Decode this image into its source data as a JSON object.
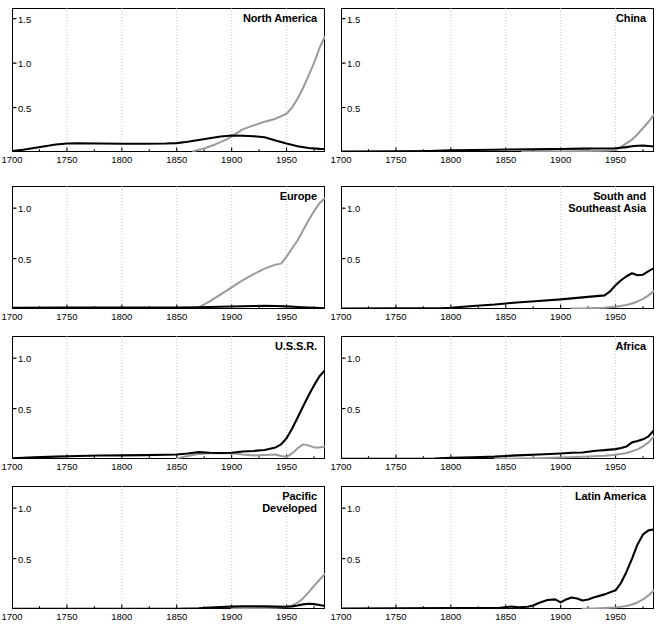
{
  "figure": {
    "layout": "4 rows x 2 columns small-multiples",
    "rows": 4,
    "cols": 2,
    "colors": {
      "black_series": "#000000",
      "gray_series": "#9a9a9a",
      "grid": "#b9b9b9",
      "axis": "#000000",
      "background": "#ffffff"
    }
  },
  "chart_data": [
    {
      "type": "line",
      "title": "North America",
      "xlabel": "",
      "ylabel": "",
      "xlim": [
        1700,
        1985
      ],
      "ylim": [
        0,
        1.62
      ],
      "xticks": [
        1700,
        1750,
        1800,
        1850,
        1900,
        1950
      ],
      "xticklabels": [
        "1700",
        "1750",
        "1800",
        "1850",
        "1900",
        "1950"
      ],
      "yticks": [
        0.5,
        1.0,
        1.5
      ],
      "yticklabels": [
        "0.5",
        "1.0",
        "1.5"
      ],
      "grid": true,
      "legend": "none",
      "series": [
        {
          "name": "black",
          "color": "#000000",
          "x": [
            1700,
            1710,
            1720,
            1730,
            1740,
            1750,
            1760,
            1780,
            1800,
            1820,
            1840,
            1850,
            1860,
            1870,
            1880,
            1890,
            1900,
            1910,
            1920,
            1930,
            1940,
            1950,
            1960,
            1970,
            1980,
            1985
          ],
          "values": [
            0.01,
            0.025,
            0.045,
            0.065,
            0.085,
            0.095,
            0.097,
            0.095,
            0.093,
            0.093,
            0.095,
            0.1,
            0.115,
            0.135,
            0.155,
            0.175,
            0.185,
            0.183,
            0.178,
            0.165,
            0.13,
            0.095,
            0.065,
            0.045,
            0.035,
            0.033
          ]
        },
        {
          "name": "gray",
          "color": "#9a9a9a",
          "x": [
            1865,
            1875,
            1885,
            1895,
            1900,
            1905,
            1910,
            1920,
            1930,
            1940,
            1950,
            1955,
            1960,
            1965,
            1970,
            1975,
            1980,
            1985
          ],
          "values": [
            0.01,
            0.04,
            0.085,
            0.14,
            0.175,
            0.215,
            0.255,
            0.3,
            0.34,
            0.375,
            0.43,
            0.5,
            0.6,
            0.72,
            0.86,
            1.0,
            1.17,
            1.3
          ]
        }
      ]
    },
    {
      "type": "line",
      "title": "China",
      "xlabel": "",
      "ylabel": "",
      "xlim": [
        1700,
        1985
      ],
      "ylim": [
        0,
        1.62
      ],
      "xticks": [
        1700,
        1750,
        1800,
        1850,
        1900,
        1950
      ],
      "xticklabels": [
        "1700",
        "1750",
        "1800",
        "1850",
        "1900",
        "1950"
      ],
      "yticks": [
        0.5,
        1.0,
        1.5
      ],
      "yticklabels": [
        "0.5",
        "1.0",
        "1.5"
      ],
      "grid": true,
      "legend": "none",
      "series": [
        {
          "name": "black",
          "color": "#000000",
          "x": [
            1700,
            1750,
            1780,
            1800,
            1820,
            1840,
            1850,
            1870,
            1890,
            1900,
            1920,
            1930,
            1940,
            1950,
            1960,
            1965,
            1970,
            1975,
            1980,
            1985
          ],
          "values": [
            0.005,
            0.008,
            0.012,
            0.018,
            0.022,
            0.026,
            0.028,
            0.03,
            0.032,
            0.034,
            0.038,
            0.04,
            0.04,
            0.042,
            0.055,
            0.065,
            0.07,
            0.072,
            0.068,
            0.062
          ]
        },
        {
          "name": "gray",
          "color": "#9a9a9a",
          "x": [
            1865,
            1880,
            1900,
            1920,
            1940,
            1950,
            1955,
            1960,
            1965,
            1970,
            1975,
            1980,
            1985
          ],
          "values": [
            0.004,
            0.005,
            0.007,
            0.01,
            0.014,
            0.022,
            0.055,
            0.1,
            0.14,
            0.2,
            0.27,
            0.34,
            0.42
          ]
        }
      ]
    },
    {
      "type": "line",
      "title": "Europe",
      "xlabel": "",
      "ylabel": "",
      "xlim": [
        1700,
        1985
      ],
      "ylim": [
        0,
        1.22
      ],
      "xticks": [
        1700,
        1750,
        1800,
        1850,
        1900,
        1950
      ],
      "xticklabels": [
        "1700",
        "1750",
        "1800",
        "1850",
        "1900",
        "1950"
      ],
      "yticks": [
        0.5,
        1.0
      ],
      "yticklabels": [
        "0.5",
        "1.0"
      ],
      "grid": true,
      "legend": "none",
      "series": [
        {
          "name": "black",
          "color": "#000000",
          "x": [
            1700,
            1750,
            1800,
            1850,
            1870,
            1880,
            1890,
            1900,
            1910,
            1920,
            1930,
            1940,
            1950,
            1960,
            1970,
            1980,
            1985
          ],
          "values": [
            0.012,
            0.014,
            0.014,
            0.015,
            0.018,
            0.02,
            0.022,
            0.025,
            0.028,
            0.03,
            0.032,
            0.03,
            0.026,
            0.02,
            0.014,
            0.01,
            0.008
          ]
        },
        {
          "name": "gray",
          "color": "#9a9a9a",
          "x": [
            1870,
            1880,
            1890,
            1900,
            1910,
            1920,
            1930,
            1940,
            1945,
            1950,
            1955,
            1960,
            1965,
            1970,
            1975,
            1980,
            1985
          ],
          "values": [
            0.015,
            0.075,
            0.145,
            0.215,
            0.285,
            0.345,
            0.4,
            0.44,
            0.45,
            0.52,
            0.6,
            0.68,
            0.78,
            0.88,
            0.97,
            1.05,
            1.1
          ]
        }
      ]
    },
    {
      "type": "line",
      "title": "South and\nSoutheast Asia",
      "xlabel": "",
      "ylabel": "",
      "xlim": [
        1700,
        1985
      ],
      "ylim": [
        0,
        1.22
      ],
      "xticks": [
        1700,
        1750,
        1800,
        1850,
        1900,
        1950
      ],
      "xticklabels": [
        "1700",
        "1750",
        "1800",
        "1850",
        "1900",
        "1950"
      ],
      "yticks": [
        0.5,
        1.0
      ],
      "yticklabels": [
        "0.5",
        "1.0"
      ],
      "grid": true,
      "legend": "none",
      "series": [
        {
          "name": "black",
          "color": "#000000",
          "x": [
            1700,
            1750,
            1790,
            1800,
            1820,
            1840,
            1850,
            1860,
            1880,
            1900,
            1920,
            1930,
            1940,
            1945,
            1950,
            1955,
            1960,
            1965,
            1970,
            1975,
            1980,
            1985
          ],
          "values": [
            0.005,
            0.006,
            0.008,
            0.012,
            0.03,
            0.045,
            0.055,
            0.065,
            0.08,
            0.095,
            0.115,
            0.125,
            0.135,
            0.175,
            0.235,
            0.285,
            0.325,
            0.355,
            0.335,
            0.34,
            0.375,
            0.405
          ]
        },
        {
          "name": "gray",
          "color": "#9a9a9a",
          "x": [
            1910,
            1920,
            1930,
            1940,
            1950,
            1960,
            1965,
            1970,
            1975,
            1980,
            1985
          ],
          "values": [
            0.004,
            0.006,
            0.009,
            0.013,
            0.022,
            0.04,
            0.055,
            0.075,
            0.1,
            0.135,
            0.18
          ]
        }
      ]
    },
    {
      "type": "line",
      "title": "U.S.S.R.",
      "xlabel": "",
      "ylabel": "",
      "xlim": [
        1700,
        1985
      ],
      "ylim": [
        0,
        1.22
      ],
      "xticks": [
        1700,
        1750,
        1800,
        1850,
        1900,
        1950
      ],
      "xticklabels": [
        "1700",
        "1750",
        "1800",
        "1850",
        "1900",
        "1950"
      ],
      "yticks": [
        0.5,
        1.0
      ],
      "yticklabels": [
        "0.5",
        "1.0"
      ],
      "grid": true,
      "legend": "none",
      "series": [
        {
          "name": "black",
          "color": "#000000",
          "x": [
            1700,
            1720,
            1740,
            1760,
            1780,
            1800,
            1820,
            1840,
            1850,
            1860,
            1870,
            1880,
            1890,
            1900,
            1910,
            1920,
            1930,
            1940,
            1945,
            1950,
            1955,
            1960,
            1965,
            1970,
            1975,
            1980,
            1985
          ],
          "values": [
            0.008,
            0.016,
            0.024,
            0.03,
            0.034,
            0.036,
            0.038,
            0.042,
            0.045,
            0.055,
            0.068,
            0.062,
            0.06,
            0.062,
            0.075,
            0.08,
            0.09,
            0.115,
            0.145,
            0.205,
            0.3,
            0.41,
            0.52,
            0.63,
            0.73,
            0.82,
            0.88
          ]
        },
        {
          "name": "gray",
          "color": "#9a9a9a",
          "x": [
            1850,
            1860,
            1870,
            1880,
            1890,
            1900,
            1910,
            1920,
            1930,
            1940,
            1945,
            1950,
            1955,
            1960,
            1965,
            1970,
            1975,
            1980,
            1985
          ],
          "values": [
            0.006,
            0.03,
            0.05,
            0.058,
            0.056,
            0.058,
            0.045,
            0.035,
            0.04,
            0.045,
            0.03,
            0.022,
            0.055,
            0.105,
            0.145,
            0.135,
            0.115,
            0.115,
            0.125
          ]
        }
      ]
    },
    {
      "type": "line",
      "title": "Africa",
      "xlabel": "",
      "ylabel": "",
      "xlim": [
        1700,
        1985
      ],
      "ylim": [
        0,
        1.22
      ],
      "xticks": [
        1700,
        1750,
        1800,
        1850,
        1900,
        1950
      ],
      "xticklabels": [
        "1700",
        "1750",
        "1800",
        "1850",
        "1900",
        "1950"
      ],
      "yticks": [
        0.5,
        1.0
      ],
      "yticklabels": [
        "0.5",
        "1.0"
      ],
      "grid": true,
      "legend": "none",
      "series": [
        {
          "name": "black",
          "color": "#000000",
          "x": [
            1700,
            1750,
            1785,
            1800,
            1820,
            1840,
            1850,
            1860,
            1880,
            1900,
            1910,
            1920,
            1930,
            1935,
            1940,
            1950,
            1955,
            1960,
            1965,
            1970,
            1975,
            1980,
            1985
          ],
          "values": [
            0.003,
            0.003,
            0.005,
            0.012,
            0.018,
            0.024,
            0.03,
            0.036,
            0.044,
            0.055,
            0.062,
            0.065,
            0.08,
            0.085,
            0.088,
            0.098,
            0.11,
            0.125,
            0.165,
            0.178,
            0.195,
            0.225,
            0.285
          ]
        },
        {
          "name": "gray",
          "color": "#9a9a9a",
          "x": [
            1840,
            1860,
            1880,
            1900,
            1920,
            1940,
            1950,
            1960,
            1970,
            1975,
            1980,
            1985
          ],
          "values": [
            0.002,
            0.004,
            0.008,
            0.014,
            0.022,
            0.032,
            0.042,
            0.06,
            0.095,
            0.125,
            0.165,
            0.225
          ]
        }
      ]
    },
    {
      "type": "line",
      "title": "Pacific\nDeveloped",
      "xlabel": "",
      "ylabel": "",
      "xlim": [
        1700,
        1985
      ],
      "ylim": [
        0,
        1.22
      ],
      "xticks": [
        1700,
        1750,
        1800,
        1850,
        1900,
        1950
      ],
      "xticklabels": [
        "1700",
        "1750",
        "1800",
        "1850",
        "1900",
        "1950"
      ],
      "yticks": [
        0.5,
        1.0
      ],
      "yticklabels": [
        "0.5",
        "1.0"
      ],
      "grid": true,
      "legend": "none",
      "series": [
        {
          "name": "black",
          "color": "#000000",
          "x": [
            1700,
            1800,
            1850,
            1870,
            1880,
            1890,
            1900,
            1910,
            1920,
            1930,
            1940,
            1950,
            1955,
            1960,
            1965,
            1970,
            1975,
            1980,
            1985
          ],
          "values": [
            0.002,
            0.002,
            0.003,
            0.008,
            0.015,
            0.02,
            0.024,
            0.026,
            0.026,
            0.026,
            0.024,
            0.022,
            0.026,
            0.035,
            0.046,
            0.052,
            0.048,
            0.04,
            0.03
          ]
        },
        {
          "name": "gray",
          "color": "#9a9a9a",
          "x": [
            1900,
            1920,
            1940,
            1950,
            1955,
            1960,
            1965,
            1970,
            1975,
            1980,
            1985
          ],
          "values": [
            0.003,
            0.006,
            0.012,
            0.02,
            0.035,
            0.06,
            0.105,
            0.165,
            0.23,
            0.29,
            0.35
          ]
        }
      ]
    },
    {
      "type": "line",
      "title": "Latin America",
      "xlabel": "",
      "ylabel": "",
      "xlim": [
        1700,
        1985
      ],
      "ylim": [
        0,
        1.22
      ],
      "xticks": [
        1700,
        1750,
        1800,
        1850,
        1900,
        1950
      ],
      "xticklabels": [
        "1700",
        "1750",
        "1800",
        "1850",
        "1900",
        "1950"
      ],
      "yticks": [
        0.5,
        1.0
      ],
      "yticklabels": [
        "0.5",
        "1.0"
      ],
      "grid": true,
      "legend": "none",
      "series": [
        {
          "name": "black",
          "color": "#000000",
          "x": [
            1700,
            1750,
            1800,
            1830,
            1845,
            1855,
            1862,
            1870,
            1875,
            1880,
            1888,
            1895,
            1900,
            1905,
            1910,
            1915,
            1920,
            1925,
            1930,
            1940,
            1950,
            1955,
            1960,
            1965,
            1970,
            1975,
            1980,
            1985
          ],
          "values": [
            0.004,
            0.006,
            0.009,
            0.01,
            0.012,
            0.024,
            0.018,
            0.022,
            0.035,
            0.06,
            0.09,
            0.095,
            0.065,
            0.095,
            0.115,
            0.105,
            0.085,
            0.095,
            0.115,
            0.145,
            0.185,
            0.26,
            0.37,
            0.5,
            0.64,
            0.74,
            0.78,
            0.79
          ]
        },
        {
          "name": "gray",
          "color": "#9a9a9a",
          "x": [
            1920,
            1930,
            1940,
            1950,
            1960,
            1965,
            1970,
            1975,
            1980,
            1985
          ],
          "values": [
            0.003,
            0.006,
            0.01,
            0.016,
            0.03,
            0.045,
            0.065,
            0.095,
            0.135,
            0.185
          ]
        }
      ]
    }
  ],
  "panels": [
    {
      "key": "north-america",
      "row": 0,
      "col": 0
    },
    {
      "key": "china",
      "row": 0,
      "col": 1
    },
    {
      "key": "europe",
      "row": 1,
      "col": 0
    },
    {
      "key": "south-and-southeast-asia",
      "row": 1,
      "col": 1
    },
    {
      "key": "ussr",
      "row": 2,
      "col": 0
    },
    {
      "key": "africa",
      "row": 2,
      "col": 1
    },
    {
      "key": "pacific-developed",
      "row": 3,
      "col": 0
    },
    {
      "key": "latin-america",
      "row": 3,
      "col": 1
    }
  ]
}
